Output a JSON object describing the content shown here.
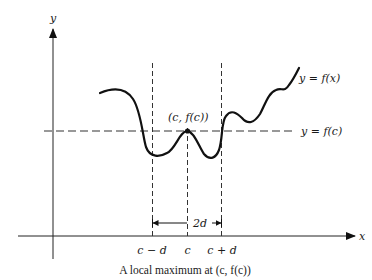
{
  "figure": {
    "caption": "A local maximum at (c, f(c))",
    "axes": {
      "x_label": "x",
      "y_label": "y"
    },
    "curve_label": "y = f(x)",
    "horizontal_line_label": "y = f(c)",
    "point_label": "(c, f(c))",
    "x_ticks": [
      "c − d",
      "c",
      "c + d"
    ],
    "interval_label": "2d",
    "colors": {
      "ink": "#111111",
      "background": "#ffffff"
    }
  }
}
